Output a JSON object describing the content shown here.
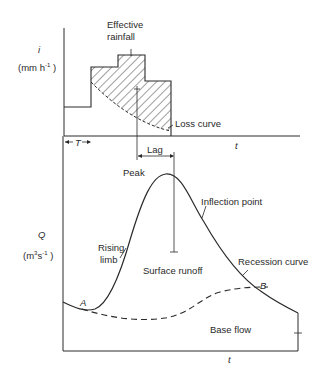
{
  "colors": {
    "ink": "#2a2a2a",
    "background": "#ffffff"
  },
  "hyetograph": {
    "y_axis_symbol": "i",
    "y_axis_unit_prefix": "(mm h",
    "y_axis_unit_exp": "-1",
    "y_axis_unit_suffix": " )",
    "x_axis_symbol": "t",
    "effective_rainfall_label_line1": "Effective",
    "effective_rainfall_label_line2": "rainfall",
    "loss_curve_label": "Loss curve",
    "time_to_start_label": "T",
    "lag_label": "Lag"
  },
  "hydrograph": {
    "y_axis_symbol": "Q",
    "y_axis_unit_prefix": "(m",
    "y_axis_unit_exp1": "3",
    "y_axis_unit_mid": "s",
    "y_axis_unit_exp2": "-1",
    "y_axis_unit_suffix": " )",
    "x_axis_symbol": "t",
    "peak_label": "Peak",
    "inflection_label": "Inflection point",
    "rising_limb_line1": "Rising",
    "rising_limb_line2": "limb",
    "surface_runoff_label": "Surface runoff",
    "recession_label": "Recession curve",
    "point_a_label": "A",
    "point_b_label": "B",
    "base_flow_label": "Base flow"
  }
}
